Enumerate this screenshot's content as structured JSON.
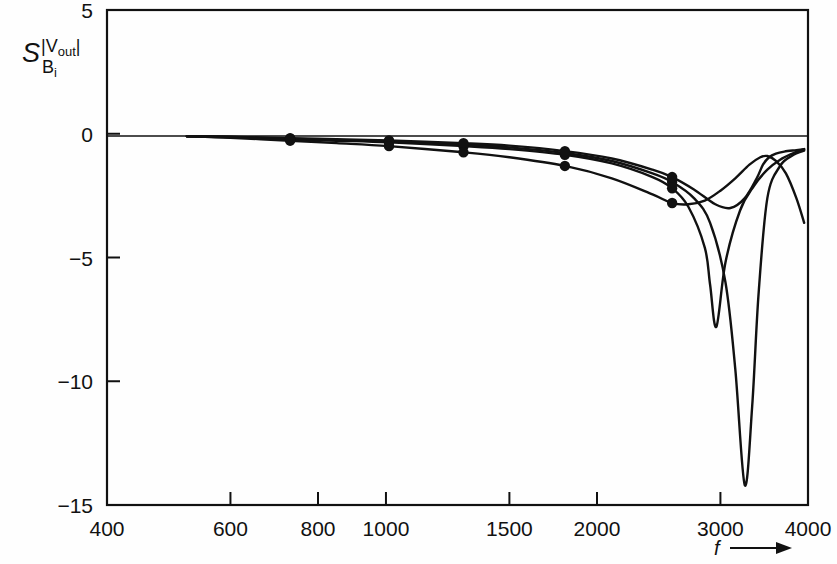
{
  "chart_data": {
    "type": "line",
    "title": "",
    "xlabel": "f",
    "ylabel": "S |Vout| / Bi",
    "xscale": "log",
    "yscale": "linear",
    "xlim": [
      400,
      4000
    ],
    "ylim": [
      -15,
      5
    ],
    "grid": false,
    "legend": "none",
    "xticks": [
      400,
      600,
      800,
      1000,
      1500,
      2000,
      3000,
      4000
    ],
    "xtick_labels": [
      "400",
      "600",
      "800",
      "1000",
      "1500",
      "2000",
      "3000",
      "4000"
    ],
    "yticks": [
      5,
      0,
      -5,
      -10,
      -15
    ],
    "ytick_labels": [
      "5",
      "0",
      "-5",
      "-10",
      "-15"
    ],
    "marker_style": "filled-circle",
    "marker_frequencies": [
      730,
      1010,
      1290,
      1800,
      2560
    ],
    "series": [
      {
        "name": "B1",
        "x": [
          520,
          600,
          730,
          850,
          1010,
          1290,
          1500,
          1800,
          2100,
          2400,
          2560,
          2700,
          2850,
          2900,
          2960,
          3050,
          3200,
          3350,
          3500,
          3650,
          3800,
          3950
        ],
        "values": [
          -0.1,
          -0.14,
          -0.22,
          -0.28,
          -0.35,
          -0.5,
          -0.62,
          -0.85,
          -1.2,
          -1.75,
          -2.2,
          -2.95,
          -4.6,
          -6.1,
          -7.8,
          -5.2,
          -3.1,
          -2.1,
          -1.45,
          -1.05,
          -0.8,
          -0.62
        ]
      },
      {
        "name": "B2",
        "x": [
          520,
          600,
          730,
          850,
          1010,
          1290,
          1500,
          1800,
          2100,
          2400,
          2560,
          2750,
          2900,
          3050,
          3150,
          3250,
          3330,
          3400,
          3500,
          3650,
          3800,
          3950
        ],
        "values": [
          -0.1,
          -0.13,
          -0.2,
          -0.25,
          -0.31,
          -0.44,
          -0.55,
          -0.78,
          -1.1,
          -1.6,
          -1.95,
          -2.6,
          -3.6,
          -6.0,
          -9.5,
          -14.2,
          -11.0,
          -6.5,
          -2.6,
          -1.3,
          -0.88,
          -0.68
        ]
      },
      {
        "name": "B3",
        "x": [
          520,
          600,
          730,
          850,
          1010,
          1290,
          1500,
          1800,
          2100,
          2400,
          2560,
          2750,
          2950,
          3100,
          3250,
          3380,
          3450,
          3520,
          3600,
          3700,
          3850,
          3950
        ],
        "values": [
          -0.1,
          -0.12,
          -0.18,
          -0.22,
          -0.27,
          -0.38,
          -0.48,
          -0.7,
          -1.0,
          -1.45,
          -1.75,
          -2.25,
          -2.85,
          -3.0,
          -2.6,
          -1.8,
          -1.25,
          -0.95,
          -0.8,
          -0.72,
          -0.66,
          -0.62
        ]
      },
      {
        "name": "B4",
        "x": [
          520,
          600,
          730,
          850,
          1010,
          1290,
          1500,
          1800,
          2100,
          2400,
          2560,
          2700,
          2850,
          3000,
          3150,
          3300,
          3420,
          3500,
          3600,
          3720,
          3850,
          3950
        ],
        "values": [
          -0.1,
          -0.16,
          -0.28,
          -0.38,
          -0.5,
          -0.75,
          -0.95,
          -1.3,
          -1.8,
          -2.45,
          -2.8,
          -2.85,
          -2.7,
          -2.3,
          -1.8,
          -1.25,
          -0.95,
          -0.9,
          -1.1,
          -1.6,
          -2.6,
          -3.6
        ]
      }
    ],
    "axis_label_y_main": "S",
    "axis_label_y_sup": "|Vout|",
    "axis_label_y_sub": "Bi"
  },
  "axes": {
    "x_axis_name": "frequency-axis",
    "y_axis_name": "sensitivity-axis",
    "arrow_label": "f"
  }
}
